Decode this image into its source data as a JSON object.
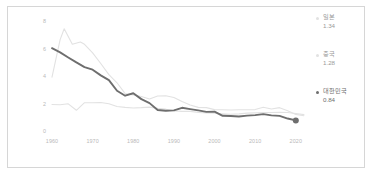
{
  "chart_data": {
    "type": "line",
    "title": "",
    "xlabel": "",
    "ylabel": "",
    "xlim": [
      1960,
      2023
    ],
    "ylim": [
      0,
      8
    ],
    "grid": false,
    "legend_position": "right",
    "yticks": [
      "8",
      "6",
      "4",
      "2",
      "0"
    ],
    "ytick_values": [
      8,
      6,
      4,
      2,
      0
    ],
    "xticks": [
      "1960",
      "1970",
      "1980",
      "1990",
      "2000",
      "2010",
      "2020"
    ],
    "xtick_values": [
      1960,
      1970,
      1980,
      1990,
      2000,
      2010,
      2020
    ],
    "series": [
      {
        "name": "일본",
        "label_value": "1.34",
        "color": "#e2e2e2",
        "end_marker": false,
        "x": [
          1960,
          1962,
          1964,
          1966,
          1968,
          1970,
          1972,
          1974,
          1976,
          1978,
          1980,
          1982,
          1984,
          1986,
          1988,
          1990,
          1992,
          1994,
          1996,
          1998,
          2000,
          2002,
          2004,
          2006,
          2008,
          2010,
          2012,
          2014,
          2016,
          2018,
          2020,
          2022
        ],
        "values": [
          2.0,
          1.98,
          2.05,
          1.58,
          2.13,
          2.13,
          2.14,
          2.05,
          1.85,
          1.79,
          1.75,
          1.77,
          1.81,
          1.72,
          1.66,
          1.54,
          1.5,
          1.5,
          1.43,
          1.38,
          1.36,
          1.32,
          1.29,
          1.32,
          1.37,
          1.39,
          1.41,
          1.42,
          1.44,
          1.42,
          1.34,
          1.26
        ]
      },
      {
        "name": "중국",
        "label_value": "1.28",
        "color": "#e2e2e2",
        "end_marker": false,
        "x": [
          1960,
          1962,
          1963,
          1965,
          1967,
          1968,
          1970,
          1972,
          1974,
          1976,
          1978,
          1980,
          1982,
          1984,
          1986,
          1988,
          1990,
          1992,
          1994,
          1996,
          1998,
          2000,
          2002,
          2004,
          2006,
          2008,
          2010,
          2012,
          2014,
          2016,
          2018,
          2020,
          2022
        ],
        "values": [
          3.99,
          6.72,
          7.51,
          6.38,
          6.55,
          6.38,
          5.75,
          4.98,
          4.17,
          3.58,
          2.79,
          2.69,
          2.58,
          2.4,
          2.62,
          2.64,
          2.51,
          2.22,
          1.96,
          1.79,
          1.77,
          1.63,
          1.62,
          1.6,
          1.62,
          1.62,
          1.63,
          1.8,
          1.67,
          1.77,
          1.55,
          1.28,
          1.18
        ]
      },
      {
        "name": "대한민국",
        "label_value": "0.84",
        "color": "#6e6e6e",
        "end_marker": true,
        "x": [
          1960,
          1962,
          1964,
          1966,
          1968,
          1970,
          1972,
          1974,
          1976,
          1978,
          1980,
          1982,
          1984,
          1986,
          1988,
          1990,
          1992,
          1994,
          1996,
          1998,
          2000,
          2002,
          2004,
          2006,
          2008,
          2010,
          2012,
          2014,
          2016,
          2018,
          2020
        ],
        "values": [
          6.1,
          5.79,
          5.42,
          5.06,
          4.72,
          4.53,
          4.12,
          3.77,
          3.0,
          2.64,
          2.82,
          2.39,
          2.1,
          1.6,
          1.55,
          1.57,
          1.76,
          1.66,
          1.57,
          1.46,
          1.48,
          1.18,
          1.16,
          1.13,
          1.19,
          1.23,
          1.3,
          1.21,
          1.17,
          0.98,
          0.84
        ]
      }
    ]
  },
  "legend": {
    "entries": [
      {
        "name": "일본",
        "value": "1.34"
      },
      {
        "name": "중국",
        "value": "1.28"
      },
      {
        "name": "대한민국",
        "value": "0.84"
      }
    ]
  },
  "colors": {
    "korea_line": "#6e6e6e",
    "other_line": "#e2e2e2",
    "tick_text": "#b9b9b9",
    "legend_text": "#9a9a9a",
    "legend_text_dark": "#6e6e6e",
    "frame_border": "#d6d6d6",
    "background": "#ffffff"
  }
}
